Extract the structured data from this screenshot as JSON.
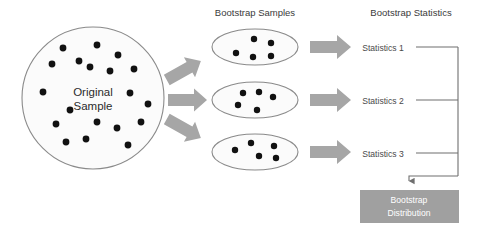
{
  "diagram": {
    "background_color": "#ffffff",
    "width": 480,
    "height": 238
  },
  "headers": {
    "bootstrap_samples": "Bootstrap Samples",
    "bootstrap_statistics": "Bootstrap Statistics"
  },
  "original_sample": {
    "label_line1": "Original",
    "label_line2": "Sample",
    "shape": "circle",
    "center": [
      93,
      98
    ],
    "radius": 71,
    "fill": "#fbfbfb",
    "stroke": "#8a8a8a",
    "dot_count": 19,
    "dot_color": "#111111",
    "dot_radius": 3.4,
    "dots": [
      [
        63,
        48
      ],
      [
        97,
        45
      ],
      [
        79,
        61
      ],
      [
        118,
        55
      ],
      [
        52,
        64
      ],
      [
        90,
        67
      ],
      [
        110,
        71
      ],
      [
        134,
        69
      ],
      [
        43,
        92
      ],
      [
        130,
        93
      ],
      [
        56,
        124
      ],
      [
        97,
        122
      ],
      [
        117,
        128
      ],
      [
        141,
        122
      ],
      [
        66,
        142
      ],
      [
        86,
        139
      ],
      [
        128,
        145
      ],
      [
        70,
        110
      ],
      [
        148,
        104
      ]
    ]
  },
  "fan_arrows": {
    "color": "#a6a6a6",
    "count": 3,
    "directions": [
      "up",
      "straight",
      "down"
    ]
  },
  "bootstrap_samples": {
    "fill": "#fbfbfb",
    "stroke": "#8a8a8a",
    "dot_color": "#111111",
    "dot_radius": 3.2,
    "items": [
      {
        "name": "bootstrap-sample-1",
        "center": [
          255,
          47
        ],
        "rx": 43,
        "ry": 18,
        "dots": [
          [
            236,
            53
          ],
          [
            254,
            39
          ],
          [
            271,
            43
          ],
          [
            253,
            57
          ],
          [
            271,
            56
          ]
        ]
      },
      {
        "name": "bootstrap-sample-2",
        "center": [
          255,
          100
        ],
        "rx": 43,
        "ry": 18,
        "dots": [
          [
            243,
            93
          ],
          [
            259,
            92
          ],
          [
            273,
            97
          ],
          [
            238,
            105
          ],
          [
            257,
            110
          ]
        ]
      },
      {
        "name": "bootstrap-sample-3",
        "center": [
          255,
          152
        ],
        "rx": 43,
        "ry": 18,
        "dots": [
          [
            235,
            150
          ],
          [
            251,
            143
          ],
          [
            259,
            156
          ],
          [
            274,
            146
          ],
          [
            276,
            158
          ]
        ]
      }
    ]
  },
  "transfer_arrows": {
    "color": "#a6a6a6",
    "count": 3
  },
  "statistics": {
    "color": "#4a4a4a",
    "items": [
      {
        "name": "statistics-1",
        "label": "Statistics 1",
        "x": 383,
        "y": 48
      },
      {
        "name": "statistics-2",
        "label": "Statistics 2",
        "x": 383,
        "y": 101
      },
      {
        "name": "statistics-3",
        "label": "Statistics 3",
        "x": 383,
        "y": 154
      }
    ]
  },
  "connector": {
    "color": "#6f6f6f",
    "junction_x": 458,
    "arrow_down_x": 409,
    "description": "bracket joining three statistics into the bootstrap distribution"
  },
  "bootstrap_distribution": {
    "label_line1": "Bootstrap",
    "label_line2": "Distribution",
    "x": 360,
    "y": 190,
    "width": 99,
    "height": 33,
    "fill": "#a0a0a0",
    "text_color": "#ffffff"
  }
}
